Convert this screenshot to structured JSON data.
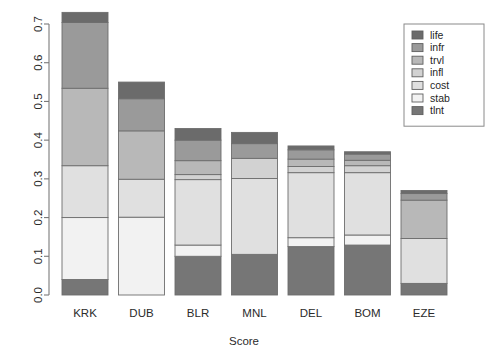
{
  "chart_data": {
    "type": "bar",
    "stacked": true,
    "title": "",
    "subtitle": "",
    "xlabel": "Score",
    "ylabel": "",
    "categories": [
      "KRK",
      "DUB",
      "BLR",
      "MNL",
      "DEL",
      "BOM",
      "EZE"
    ],
    "ylim": [
      0.0,
      0.73
    ],
    "yticks": [
      0.0,
      0.1,
      0.2,
      0.3,
      0.4,
      0.5,
      0.6,
      0.7
    ],
    "ytick_labels": [
      "0.0",
      "0.1",
      "0.2",
      "0.3",
      "0.4",
      "0.5",
      "0.6",
      "0.7"
    ],
    "grid": false,
    "legend_position": "top-right",
    "legend_order_top_to_bottom": [
      "life",
      "infr",
      "trvl",
      "infl",
      "cost",
      "stab",
      "tlnt"
    ],
    "stack_order_bottom_to_top": [
      "tlnt",
      "stab",
      "cost",
      "infl",
      "trvl",
      "infr",
      "life"
    ],
    "series": [
      {
        "name": "tlnt",
        "color": "#767676",
        "values": [
          0.04,
          0.0,
          0.1,
          0.105,
          0.125,
          0.129,
          0.03
        ]
      },
      {
        "name": "stab",
        "color": "#f2f2f2",
        "values": [
          0.16,
          0.201,
          0.029,
          0.0,
          0.023,
          0.026,
          0.0
        ]
      },
      {
        "name": "cost",
        "color": "#e0e0e0",
        "values": [
          0.134,
          0.098,
          0.169,
          0.196,
          0.168,
          0.161,
          0.116
        ]
      },
      {
        "name": "infl",
        "color": "#d2d2d2",
        "values": [
          0.0,
          0.0,
          0.013,
          0.052,
          0.016,
          0.018,
          0.0
        ]
      },
      {
        "name": "trvl",
        "color": "#b8b8b8",
        "values": [
          0.2,
          0.125,
          0.036,
          0.0,
          0.019,
          0.014,
          0.099
        ]
      },
      {
        "name": "infr",
        "color": "#9a9a9a",
        "values": [
          0.17,
          0.083,
          0.053,
          0.038,
          0.024,
          0.016,
          0.017
        ]
      },
      {
        "name": "life",
        "color": "#6b6b6b",
        "values": [
          0.026,
          0.043,
          0.03,
          0.029,
          0.01,
          0.006,
          0.008
        ]
      }
    ],
    "totals": [
      0.73,
      0.59,
      0.43,
      0.42,
      0.385,
      0.37,
      0.29
    ]
  },
  "legend": {
    "items": [
      {
        "label": "life",
        "color": "#6b6b6b"
      },
      {
        "label": "infr",
        "color": "#9a9a9a"
      },
      {
        "label": "trvl",
        "color": "#b8b8b8"
      },
      {
        "label": "infl",
        "color": "#d2d2d2"
      },
      {
        "label": "cost",
        "color": "#e0e0e0"
      },
      {
        "label": "stab",
        "color": "#f2f2f2"
      },
      {
        "label": "tlnt",
        "color": "#767676"
      }
    ]
  },
  "axis": {
    "x_title": "Score"
  }
}
